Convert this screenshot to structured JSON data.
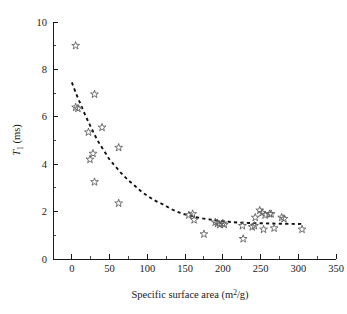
{
  "figure": {
    "background_color": "#ffffff",
    "marker_color": "#5a5a5a",
    "curve_color": "#111111",
    "axis_color": "#1a1a1a"
  },
  "chart_data": {
    "type": "scatter",
    "title": "",
    "xlabel_text": "Specific surface area (m",
    "xlabel_sup": "2",
    "xlabel_tail": "/g)",
    "xlabel": "Specific surface area (m2/g)",
    "ylabel_text": "T",
    "ylabel_sub": "1",
    "ylabel_tail": " (ms)",
    "ylabel": "T1 (ms)",
    "xlim": [
      -25,
      350
    ],
    "ylim": [
      0,
      10
    ],
    "xticks": [
      0,
      50,
      100,
      150,
      200,
      250,
      300,
      350
    ],
    "xtick_labels": [
      "0",
      "50",
      "100",
      "150",
      "200",
      "250",
      "300",
      "350"
    ],
    "yticks": [
      0,
      2,
      4,
      6,
      8,
      10
    ],
    "ytick_labels": [
      "0",
      "2",
      "4",
      "6",
      "8",
      "10"
    ],
    "y_minor_ticks": [
      1,
      3,
      5,
      7,
      9
    ],
    "x_minor_ticks": [
      25,
      75,
      125,
      175,
      225,
      275,
      325
    ],
    "grid": false,
    "legend": "none",
    "marker_symbol": "open-star",
    "series": [
      {
        "name": "T1 measurements",
        "points": [
          [
            5,
            9.0
          ],
          [
            5,
            6.4
          ],
          [
            8,
            6.35
          ],
          [
            22,
            5.35
          ],
          [
            30,
            6.95
          ],
          [
            28,
            4.45
          ],
          [
            24,
            4.2
          ],
          [
            40,
            5.55
          ],
          [
            62,
            4.7
          ],
          [
            30,
            3.25
          ],
          [
            62,
            2.35
          ],
          [
            155,
            1.85
          ],
          [
            160,
            1.9
          ],
          [
            162,
            1.65
          ],
          [
            175,
            1.05
          ],
          [
            190,
            1.55
          ],
          [
            193,
            1.5
          ],
          [
            196,
            1.45
          ],
          [
            200,
            1.5
          ],
          [
            202,
            1.45
          ],
          [
            226,
            1.4
          ],
          [
            227,
            0.85
          ],
          [
            239,
            1.35
          ],
          [
            242,
            1.4
          ],
          [
            243,
            1.75
          ],
          [
            249,
            2.05
          ],
          [
            252,
            1.95
          ],
          [
            254,
            1.25
          ],
          [
            256,
            1.85
          ],
          [
            262,
            1.9
          ],
          [
            264,
            1.9
          ],
          [
            268,
            1.3
          ],
          [
            278,
            1.75
          ],
          [
            281,
            1.7
          ],
          [
            305,
            1.25
          ]
        ]
      }
    ],
    "fit_curve": {
      "name": "exponential decay fit",
      "style": "dashed",
      "points": [
        [
          0,
          7.45
        ],
        [
          6,
          6.95
        ],
        [
          12,
          6.5
        ],
        [
          18,
          6.05
        ],
        [
          24,
          5.65
        ],
        [
          30,
          5.25
        ],
        [
          36,
          4.9
        ],
        [
          43,
          4.55
        ],
        [
          50,
          4.2
        ],
        [
          58,
          3.9
        ],
        [
          66,
          3.6
        ],
        [
          74,
          3.35
        ],
        [
          83,
          3.1
        ],
        [
          92,
          2.85
        ],
        [
          101,
          2.65
        ],
        [
          111,
          2.45
        ],
        [
          121,
          2.3
        ],
        [
          131,
          2.12
        ],
        [
          141,
          1.98
        ],
        [
          150,
          1.88
        ],
        [
          160,
          1.8
        ],
        [
          172,
          1.72
        ],
        [
          184,
          1.66
        ],
        [
          196,
          1.61
        ],
        [
          208,
          1.57
        ],
        [
          220,
          1.54
        ],
        [
          234,
          1.52
        ],
        [
          248,
          1.51
        ],
        [
          262,
          1.5
        ],
        [
          276,
          1.49
        ],
        [
          292,
          1.48
        ],
        [
          306,
          1.48
        ]
      ]
    }
  }
}
